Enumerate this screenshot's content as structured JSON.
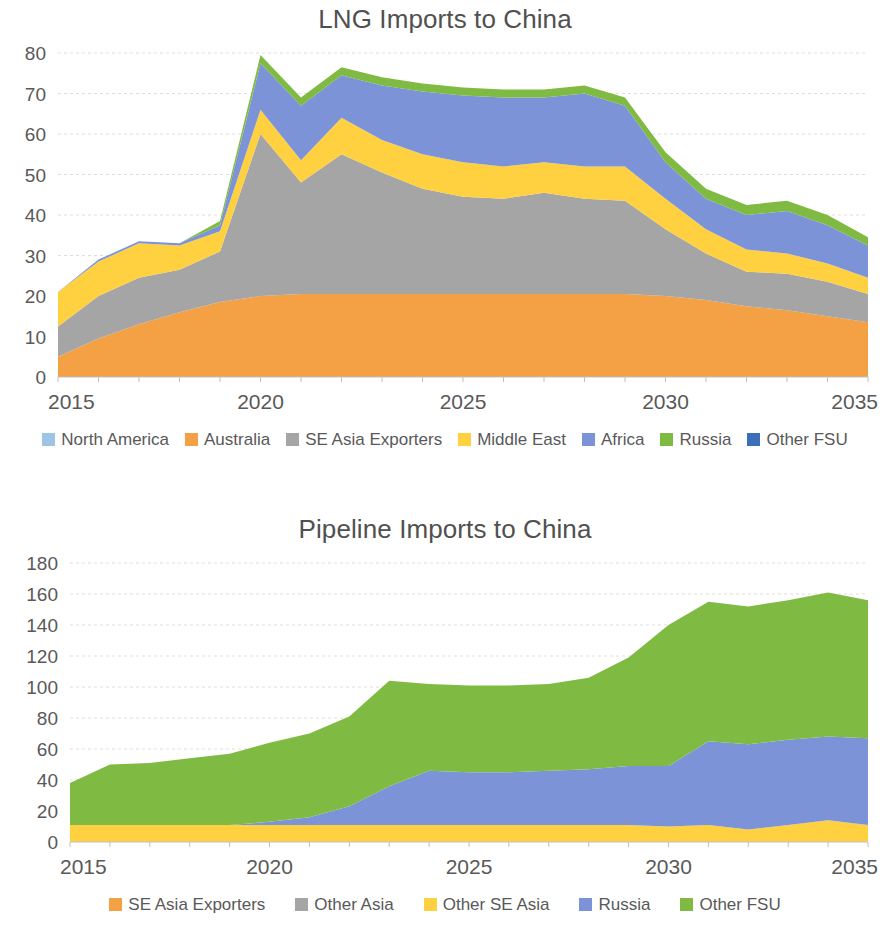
{
  "page": {
    "background": "#ffffff",
    "text_color": "#595959"
  },
  "charts": [
    {
      "id": "lng",
      "title": "LNG Imports to China"
    },
    {
      "id": "pipeline",
      "title": "Pipeline Imports to China"
    }
  ],
  "chart_data": [
    {
      "type": "area",
      "stacked": true,
      "title": "LNG Imports to China",
      "xlabel": "",
      "ylabel": "",
      "xlim": [
        2015,
        2035
      ],
      "ylim": [
        0,
        80
      ],
      "ytick_step": 10,
      "yticks": [
        0,
        10,
        20,
        30,
        40,
        50,
        60,
        70,
        80
      ],
      "xticks": [
        2015,
        2020,
        2025,
        2030,
        2035
      ],
      "xtick_labels": [
        "2015",
        "2020",
        "2025",
        "2030",
        "2035"
      ],
      "ytick_labels": [
        "0",
        "10",
        "20",
        "30",
        "40",
        "50",
        "60",
        "70",
        "80"
      ],
      "grid": true,
      "legend_position": "bottom",
      "x": [
        2015,
        2016,
        2017,
        2018,
        2019,
        2020,
        2021,
        2022,
        2023,
        2024,
        2025,
        2026,
        2027,
        2028,
        2029,
        2030,
        2031,
        2032,
        2033,
        2034,
        2035
      ],
      "series": [
        {
          "name": "North America",
          "color": "#9DC3E6",
          "values": [
            0,
            0,
            0,
            0,
            0,
            0,
            0,
            0,
            0,
            0,
            0,
            0,
            0,
            0,
            0,
            0,
            0,
            0,
            0,
            0,
            0
          ]
        },
        {
          "name": "Australia",
          "color": "#F4A045",
          "values": [
            5.0,
            9.5,
            13.0,
            16.0,
            18.5,
            20.0,
            20.5,
            20.5,
            20.5,
            20.5,
            20.5,
            20.5,
            20.5,
            20.5,
            20.5,
            20.0,
            19.0,
            17.5,
            16.5,
            15.0,
            13.5
          ]
        },
        {
          "name": "SE Asia Exporters",
          "color": "#A5A5A5",
          "values": [
            7.5,
            10.5,
            11.5,
            10.5,
            12.5,
            40.0,
            27.5,
            34.5,
            30.0,
            26.0,
            24.0,
            23.5,
            25.0,
            23.5,
            23.0,
            16.5,
            11.5,
            8.5,
            9.0,
            8.5,
            7.0
          ]
        },
        {
          "name": "Middle East",
          "color": "#FFD040",
          "values": [
            8.5,
            8.5,
            8.5,
            6.0,
            5.0,
            6.0,
            5.5,
            9.0,
            8.0,
            8.5,
            8.5,
            8.0,
            7.5,
            8.0,
            8.5,
            7.5,
            6.0,
            5.5,
            5.0,
            4.5,
            4.0
          ]
        },
        {
          "name": "Africa",
          "color": "#7C93D8",
          "values": [
            0,
            0.5,
            0.5,
            0.5,
            1.5,
            11.5,
            13.5,
            10.5,
            13.5,
            15.5,
            16.5,
            17.0,
            16.0,
            18.0,
            15.0,
            9.0,
            7.5,
            8.5,
            10.5,
            9.5,
            8.0
          ]
        },
        {
          "name": "Russia",
          "color": "#7FBA42",
          "values": [
            0,
            0,
            0,
            0,
            1.0,
            2.0,
            2.0,
            2.0,
            2.0,
            2.0,
            2.0,
            2.0,
            2.0,
            2.0,
            2.0,
            2.5,
            2.5,
            2.5,
            2.5,
            2.5,
            2.0
          ]
        },
        {
          "name": "Other FSU",
          "color": "#3B70B8",
          "values": [
            0,
            0,
            0,
            0,
            0,
            0,
            0,
            0,
            0,
            0,
            0,
            0,
            0,
            0,
            0,
            0,
            0,
            0,
            0,
            0,
            0
          ]
        }
      ],
      "legend": [
        {
          "label": "North America",
          "color": "#9DC3E6"
        },
        {
          "label": "Australia",
          "color": "#F4A045"
        },
        {
          "label": "SE Asia Exporters",
          "color": "#A5A5A5"
        },
        {
          "label": "Middle East",
          "color": "#FFD040"
        },
        {
          "label": "Africa",
          "color": "#7C93D8"
        },
        {
          "label": "Russia",
          "color": "#7FBA42"
        },
        {
          "label": "Other FSU",
          "color": "#3B70B8"
        }
      ]
    },
    {
      "type": "area",
      "stacked": true,
      "title": "Pipeline Imports to China",
      "xlabel": "",
      "ylabel": "",
      "xlim": [
        2015,
        2035
      ],
      "ylim": [
        0,
        180
      ],
      "ytick_step": 20,
      "yticks": [
        0,
        20,
        40,
        60,
        80,
        100,
        120,
        140,
        160,
        180
      ],
      "xticks": [
        2015,
        2020,
        2025,
        2030,
        2035
      ],
      "xtick_labels": [
        "2015",
        "2020",
        "2025",
        "2030",
        "2035"
      ],
      "ytick_labels": [
        "0",
        "20",
        "40",
        "60",
        "80",
        "100",
        "120",
        "140",
        "160",
        "180"
      ],
      "grid": true,
      "legend_position": "bottom",
      "x": [
        2015,
        2016,
        2017,
        2018,
        2019,
        2020,
        2021,
        2022,
        2023,
        2024,
        2025,
        2026,
        2027,
        2028,
        2029,
        2030,
        2031,
        2032,
        2033,
        2034,
        2035
      ],
      "series": [
        {
          "name": "SE Asia Exporters",
          "color": "#F4A045",
          "values": [
            0,
            0,
            0,
            0,
            0,
            0,
            0,
            0,
            0,
            0,
            0,
            0,
            0,
            0,
            0,
            0,
            0,
            0,
            0,
            0,
            0
          ]
        },
        {
          "name": "Other Asia",
          "color": "#A5A5A5",
          "values": [
            0,
            0,
            0,
            0,
            0,
            0,
            0,
            0,
            0,
            0,
            0,
            0,
            0,
            0,
            0,
            0,
            0,
            0,
            0,
            0,
            0
          ]
        },
        {
          "name": "Other SE Asia",
          "color": "#FFD040",
          "values": [
            11.0,
            11.0,
            11.0,
            11.0,
            11.0,
            11.0,
            11.0,
            11.0,
            11.0,
            11.0,
            11.0,
            11.0,
            11.0,
            11.0,
            11.0,
            10.0,
            11.0,
            8.0,
            11.0,
            14.0,
            11.0
          ]
        },
        {
          "name": "Russia",
          "color": "#7C93D8",
          "values": [
            0,
            0,
            0,
            0,
            0,
            2.0,
            5.0,
            12.0,
            25.0,
            35.0,
            34.0,
            34.0,
            35.0,
            36.0,
            38.0,
            39.0,
            54.0,
            55.0,
            55.0,
            54.0,
            56.0
          ]
        },
        {
          "name": "Other FSU",
          "color": "#7FBA42",
          "values": [
            27.0,
            39.0,
            40.0,
            43.0,
            46.0,
            51.0,
            54.0,
            58.0,
            68.0,
            56.0,
            56.0,
            56.0,
            56.0,
            59.0,
            70.0,
            91.0,
            90.0,
            89.0,
            90.0,
            93.0,
            89.0
          ]
        }
      ],
      "legend": [
        {
          "label": "SE Asia Exporters",
          "color": "#F4A045"
        },
        {
          "label": "Other Asia",
          "color": "#A5A5A5"
        },
        {
          "label": "Other SE Asia",
          "color": "#FFD040"
        },
        {
          "label": "Russia",
          "color": "#7C93D8"
        },
        {
          "label": "Other FSU",
          "color": "#7FBA42"
        }
      ]
    }
  ]
}
